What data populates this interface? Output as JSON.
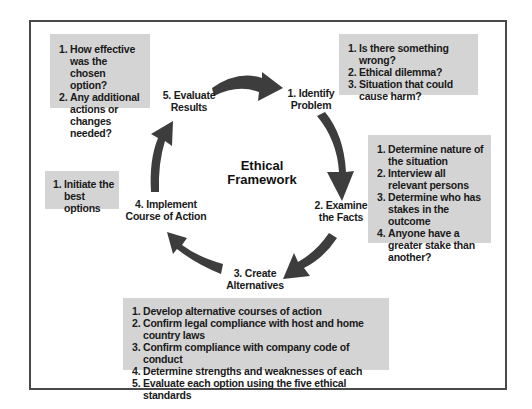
{
  "diagram": {
    "title": "Ethical Framework",
    "title_lines": [
      "Ethical",
      "Framework"
    ],
    "arrow_color": "#3d3d3d",
    "note_bg_color": "#d4d4d4",
    "frame_color": "#4a4a4a",
    "stages": [
      {
        "id": "identify",
        "lines": [
          "1. Identify",
          "Problem"
        ]
      },
      {
        "id": "examine",
        "lines": [
          "2. Examine",
          "the Facts"
        ]
      },
      {
        "id": "create",
        "lines": [
          "3. Create",
          "Alternatives"
        ]
      },
      {
        "id": "implement",
        "lines": [
          "4. Implement",
          "Course of Action"
        ]
      },
      {
        "id": "evaluate",
        "lines": [
          "5. Evaluate",
          "Results"
        ]
      }
    ],
    "notes": {
      "identify": [
        {
          "num": "1.",
          "text": "Is there something wrong?"
        },
        {
          "num": "2.",
          "text": "Ethical dilemma?"
        },
        {
          "num": "3.",
          "text": "Situation that could cause harm?"
        }
      ],
      "examine": [
        {
          "num": "1.",
          "text": "Determine nature of the situation"
        },
        {
          "num": "2.",
          "text": "Interview all relevant persons"
        },
        {
          "num": "3.",
          "text": "Determine who has stakes in the outcome"
        },
        {
          "num": "4.",
          "text": "Anyone have a greater stake than another?"
        }
      ],
      "create": [
        {
          "num": "1.",
          "text": "Develop alternative courses of action"
        },
        {
          "num": "2.",
          "text": "Confirm legal compliance with host and home country laws"
        },
        {
          "num": "3.",
          "text": "Confirm compliance with company code of conduct"
        },
        {
          "num": "4.",
          "text": "Determine strengths and weaknesses of each"
        },
        {
          "num": "5.",
          "text": "Evaluate each option using the five ethical standards"
        }
      ],
      "implement": [
        {
          "num": "1.",
          "text": "Initiate the best options"
        }
      ],
      "evaluate": [
        {
          "num": "1.",
          "text": "How effective was the chosen option?"
        },
        {
          "num": "2.",
          "text": "Any additional actions or changes needed?"
        }
      ]
    },
    "cycle_arrows": [
      {
        "from": "evaluate",
        "to": "identify"
      },
      {
        "from": "identify",
        "to": "examine"
      },
      {
        "from": "examine",
        "to": "create"
      },
      {
        "from": "create",
        "to": "implement"
      },
      {
        "from": "implement",
        "to": "evaluate"
      }
    ]
  }
}
